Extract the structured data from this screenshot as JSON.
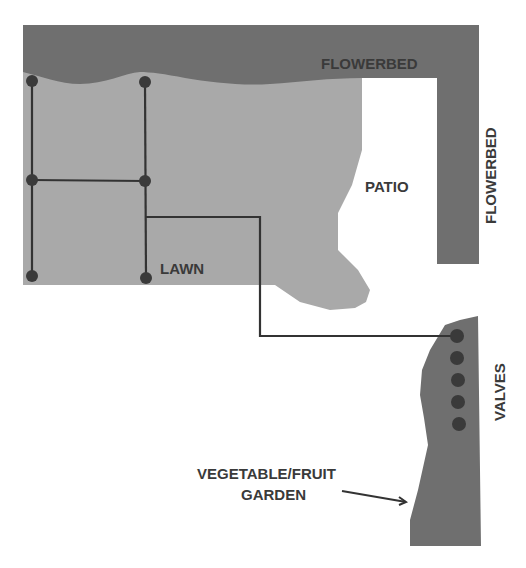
{
  "diagram": {
    "colors": {
      "flowerbed": "#6f6f6f",
      "lawn": "#a9a9a9",
      "garden": "#6f6f6f",
      "pipe": "#333333",
      "sprinkler": "#3a3a3a",
      "text": "#3a3a3a",
      "background": "#ffffff"
    },
    "labels": {
      "flowerbed_top": "FLOWERBED",
      "flowerbed_right": "FLOWERBED",
      "patio": "PATIO",
      "lawn": "LAWN",
      "valves": "VALVES",
      "garden_line1": "VEGETABLE/FRUIT",
      "garden_line2": "GARDEN"
    },
    "sprinklers": [
      {
        "x": 32,
        "y": 81
      },
      {
        "x": 145,
        "y": 82
      },
      {
        "x": 32,
        "y": 180
      },
      {
        "x": 145,
        "y": 181
      },
      {
        "x": 32,
        "y": 276
      },
      {
        "x": 146,
        "y": 278
      }
    ],
    "valves": [
      {
        "x": 457,
        "y": 336
      },
      {
        "x": 457,
        "y": 358
      },
      {
        "x": 458,
        "y": 380
      },
      {
        "x": 458,
        "y": 402
      },
      {
        "x": 459,
        "y": 424
      }
    ]
  }
}
